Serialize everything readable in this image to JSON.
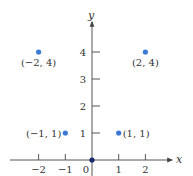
{
  "chart_data": {
    "type": "scatter",
    "title": "",
    "xlabel": "x",
    "ylabel": "y",
    "xlim": [
      -3,
      3
    ],
    "ylim": [
      0,
      4.8
    ],
    "grid": false,
    "x_ticks": [
      -2,
      -1,
      0,
      1,
      2
    ],
    "y_ticks": [
      1,
      2,
      3,
      4
    ],
    "x_tick_labels": [
      "−2",
      "−1",
      "0",
      "1",
      "2"
    ],
    "y_tick_labels": [
      "1",
      "2",
      "3",
      "4"
    ],
    "points": [
      {
        "x": -2,
        "y": 4,
        "label": "(−2, 4)",
        "label_pos": "below",
        "color": "#3a78d4"
      },
      {
        "x": 2,
        "y": 4,
        "label": "(2, 4)",
        "label_pos": "below",
        "color": "#3a78d4"
      },
      {
        "x": -1,
        "y": 1,
        "label": "(−1, 1)",
        "label_pos": "left",
        "color": "#3a78d4"
      },
      {
        "x": 1,
        "y": 1,
        "label": "(1, 1)",
        "label_pos": "right",
        "color": "#3a78d4"
      },
      {
        "x": 0,
        "y": 0,
        "label": "",
        "label_pos": "none",
        "color": "#1a2a6c"
      }
    ]
  },
  "colors": {
    "axis": "#555555",
    "point": "#3a78d4",
    "origin_point": "#1a2a6c",
    "text": "#333333"
  }
}
